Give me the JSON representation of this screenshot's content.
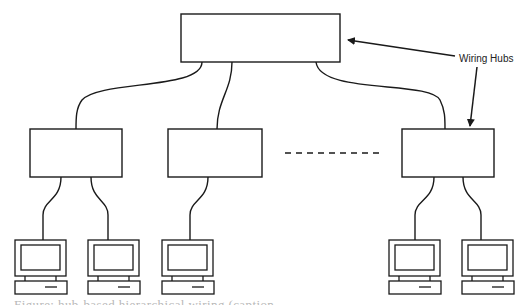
{
  "diagram": {
    "annotation": {
      "label": "Wiring Hubs"
    },
    "colors": {
      "stroke": "#1a1a1a",
      "background": "#ffffff"
    },
    "nodes": {
      "root_hub": {
        "type": "hub",
        "x": 181,
        "y": 14,
        "w": 159,
        "h": 48
      },
      "hubs": [
        {
          "type": "hub",
          "x": 30,
          "y": 129,
          "w": 92,
          "h": 48
        },
        {
          "type": "hub",
          "x": 168,
          "y": 129,
          "w": 94,
          "h": 48
        },
        {
          "type": "hub",
          "x": 402,
          "y": 129,
          "w": 92,
          "h": 48
        }
      ],
      "computers": [
        {
          "type": "computer",
          "x": 15,
          "parent_hub": 0
        },
        {
          "type": "computer",
          "x": 88,
          "parent_hub": 0
        },
        {
          "type": "computer",
          "x": 162,
          "parent_hub": 1
        },
        {
          "type": "computer",
          "x": 389,
          "parent_hub": 2
        },
        {
          "type": "computer",
          "x": 462,
          "parent_hub": 2
        }
      ]
    },
    "ellipsis": {
      "type": "dashed-line",
      "meaning": "additional hubs omitted"
    }
  },
  "caption": {
    "text": "Figure: hub-based hierarchical wiring (caption cropped)"
  }
}
